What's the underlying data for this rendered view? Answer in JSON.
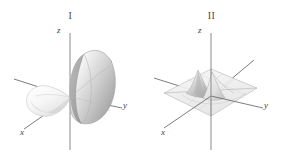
{
  "figure": {
    "background_color": "#ffffff",
    "axis_color": "#6e6e6e",
    "width": 282,
    "height": 160
  },
  "panels": [
    {
      "id": "panel-1",
      "title": "I",
      "surface_name": "p-orbital-dumbbell-surface",
      "surface_description": "two-lobed dumbbell surface; large shaded lobe toward +y, smaller pale lobe toward -y",
      "lobe_colors": {
        "large_lobe_light": "#f2f2f2",
        "large_lobe_mid": "#c9c9c9",
        "large_lobe_dark": "#a3a3a3",
        "small_lobe_light": "#fbfbfb",
        "small_lobe_mid": "#e4e4e4"
      },
      "axes": [
        {
          "name": "z",
          "label": "z",
          "direction": "vertical"
        },
        {
          "name": "y",
          "label": "y",
          "direction": "lower-right"
        },
        {
          "name": "x",
          "label": "x",
          "direction": "lower-left"
        }
      ]
    },
    {
      "id": "panel-2",
      "title": "II",
      "surface_name": "peaked-mesh-plane-surface",
      "surface_description": "flat translucent grid plane with sharp central peaks rising at the origin",
      "lobe_colors": {
        "plane_fill": "#f0f0f0",
        "plane_edge": "#b5b5b5",
        "peak_light": "#fafafa",
        "peak_mid": "#cccccc",
        "peak_dark": "#9b9b9b"
      },
      "axes": [
        {
          "name": "z",
          "label": "z",
          "direction": "vertical"
        },
        {
          "name": "y",
          "label": "y",
          "direction": "lower-right"
        },
        {
          "name": "x",
          "label": "x",
          "direction": "lower-left"
        }
      ]
    }
  ]
}
